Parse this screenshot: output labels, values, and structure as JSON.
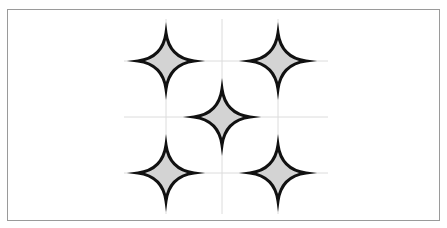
{
  "diagram": {
    "title": "",
    "frame": {
      "x": 7,
      "y": 9,
      "width": 433,
      "height": 212,
      "stroke": "#9a9a9a"
    },
    "grid": {
      "stroke": "#dcdcdc",
      "vertical_x": [
        166,
        222,
        278
      ],
      "vertical_y_range": [
        19,
        214
      ],
      "horizontal_y": [
        61,
        117,
        173
      ],
      "horizontal_x_range": [
        124,
        328
      ]
    },
    "star_style": {
      "fill": "#d3d3d3",
      "stroke": "#111111",
      "stroke_width": 3,
      "radius": 28,
      "shape": "four-point-concave-star"
    },
    "stars": [
      {
        "id": "top-left",
        "cx": 166,
        "cy": 61
      },
      {
        "id": "top-right",
        "cx": 278,
        "cy": 61
      },
      {
        "id": "center",
        "cx": 222,
        "cy": 117
      },
      {
        "id": "bottom-left",
        "cx": 166,
        "cy": 173
      },
      {
        "id": "bottom-right",
        "cx": 278,
        "cy": 173
      }
    ]
  }
}
